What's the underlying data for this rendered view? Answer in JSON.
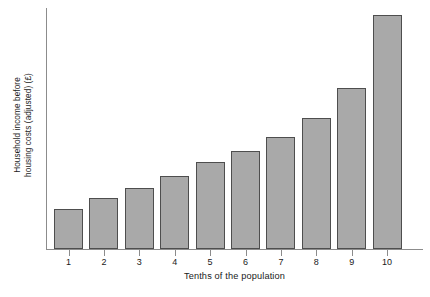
{
  "chart_data": {
    "type": "bar",
    "title": "",
    "xlabel": "Tenths of the population",
    "ylabel_line1": "Household income before",
    "ylabel_line2": "housing costs (adjusted) (£)",
    "ylabel": "Household income before housing costs (adjusted) (£)",
    "categories": [
      "1",
      "2",
      "3",
      "4",
      "5",
      "6",
      "7",
      "8",
      "9",
      "10"
    ],
    "values": [
      17,
      22,
      26,
      31,
      37,
      42,
      48,
      56,
      69,
      100
    ],
    "ylim": [
      0,
      103
    ],
    "yticks": [],
    "ytick_labels": [],
    "grid": false,
    "legend": null,
    "series": [
      {
        "name": "Household income before housing costs (adjusted)",
        "values": [
          17,
          22,
          26,
          31,
          37,
          42,
          48,
          56,
          69,
          100
        ]
      }
    ],
    "bar_fill_color": "#a9a9a9",
    "bar_border_color": "#4e4e4e",
    "axis_color": "#8c8c8c",
    "background_color": "#ffffff",
    "text_color": "#1a1a1a"
  }
}
